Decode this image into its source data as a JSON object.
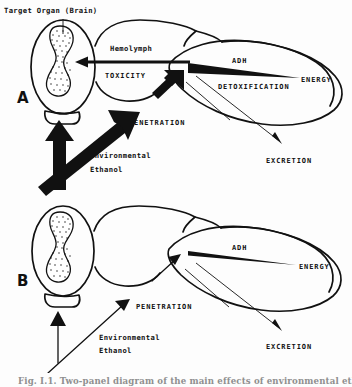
{
  "figure": {
    "caption": "Fig. I.1. Two-panel diagram of the main effects of environmental ethanol",
    "background_color": "#fdfdfd",
    "ink_color": "#111111"
  },
  "panels": [
    {
      "id": "A",
      "letter": "A",
      "name": "panel-a-high-ethanol",
      "labels": {
        "target_organ": "Target Organ (Brain)",
        "hemolymph": "Hemolymph",
        "toxicity": "TOXICITY",
        "adh": "ADH",
        "detoxification": "DETOXIFICATION",
        "energy": "ENERGY",
        "penetration": "PENETRATION",
        "environmental": "Environmental",
        "ethanol": "Ethanol",
        "excretion": "EXCRETION"
      }
    },
    {
      "id": "B",
      "letter": "B",
      "name": "panel-b-low-ethanol",
      "labels": {
        "adh": "ADH",
        "energy": "ENERGY",
        "penetration": "PENETRATION",
        "environmental": "Environmental",
        "ethanol": "Ethanol",
        "excretion": "EXCRETION"
      }
    }
  ]
}
